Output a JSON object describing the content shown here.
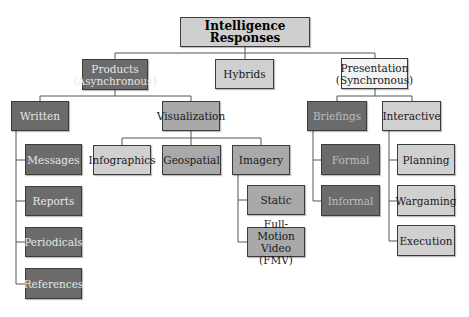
{
  "diagram": {
    "root": {
      "label": "Intelligence Responses"
    },
    "level1": {
      "products": "Products (Asynchronous)",
      "hybrids": "Hybrids",
      "presentation": "Presentation (Synchronous)"
    },
    "products_children": {
      "written": "Written",
      "visualization": "Visualization"
    },
    "written_children": [
      "Messages",
      "Reports",
      "Periodicals",
      "References"
    ],
    "visualization_children": [
      "Infographics",
      "Geospatial",
      "Imagery"
    ],
    "imagery_children": [
      "Static",
      "Full-Motion Video (FMV)"
    ],
    "presentation_children": {
      "briefings": "Briefings",
      "interactive": "Interactive"
    },
    "briefings_children": [
      "Formal",
      "Informal"
    ],
    "interactive_children": [
      "Planning",
      "Wargaming",
      "Execution"
    ]
  },
  "colors": {
    "dark": "#6b6b6b",
    "mid": "#a9a9a9",
    "light": "#d0d0d0",
    "white": "#f3f3f3",
    "connector": "#555555"
  }
}
